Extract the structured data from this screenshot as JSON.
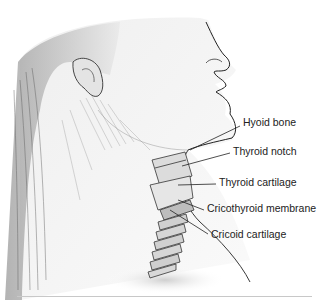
{
  "figure": {
    "labels": [
      {
        "id": "hyoid-bone",
        "text": "Hyoid bone",
        "x": 243,
        "y": 122
      },
      {
        "id": "thyroid-notch",
        "text": "Thyroid notch",
        "x": 233,
        "y": 150
      },
      {
        "id": "thyroid-cartilage",
        "text": "Thyroid cartilage",
        "x": 219,
        "y": 181
      },
      {
        "id": "cricothyroid-membrane",
        "text": "Cricothyroid membrane",
        "x": 207,
        "y": 207
      },
      {
        "id": "cricoid-cartilage",
        "text": "Cricoid cartilage",
        "x": 211,
        "y": 233
      }
    ]
  }
}
